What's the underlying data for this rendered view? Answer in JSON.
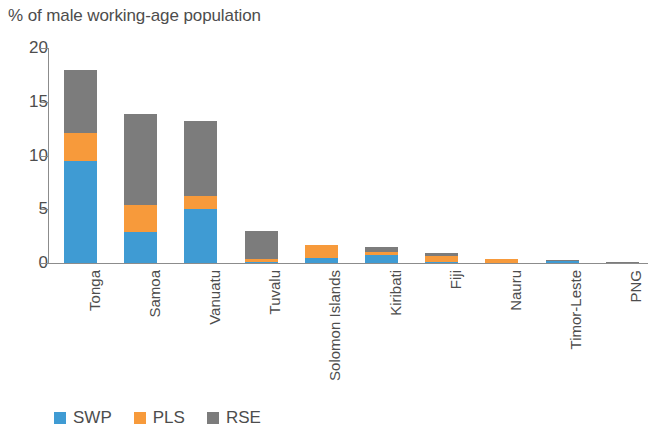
{
  "chart_data": {
    "type": "bar",
    "subtype": "stacked-vertical",
    "title": "% of male working-age population",
    "xlabel": "",
    "ylabel": "",
    "ylim": [
      0,
      20
    ],
    "yticks": [
      0,
      5,
      10,
      15,
      20
    ],
    "ytick_labels": [
      "0",
      "5",
      "10",
      "15",
      "20"
    ],
    "grid": false,
    "legend_position": "bottom-left",
    "categories": [
      "Tonga",
      "Samoa",
      "Vanuatu",
      "Tuvalu",
      "Solomon Islands",
      "Kiribati",
      "Fiji",
      "Nauru",
      "Timor-Leste",
      "PNG"
    ],
    "series": [
      {
        "name": "SWP",
        "color": "#3f9bd3",
        "values": [
          9.5,
          2.9,
          5.0,
          0.1,
          0.45,
          0.75,
          0.1,
          0.0,
          0.15,
          0.0
        ]
      },
      {
        "name": "PLS",
        "color": "#f79a3b",
        "values": [
          2.6,
          2.5,
          1.2,
          0.3,
          1.25,
          0.3,
          0.6,
          0.35,
          0.0,
          0.0
        ]
      },
      {
        "name": "RSE",
        "color": "#7c7c7c",
        "values": [
          5.9,
          8.5,
          7.0,
          2.6,
          0.0,
          0.45,
          0.2,
          0.0,
          0.1,
          0.05
        ]
      }
    ],
    "totals": [
      18.0,
      13.9,
      13.2,
      3.0,
      1.7,
      1.5,
      0.9,
      0.35,
      0.25,
      0.05
    ]
  },
  "legend": {
    "items": [
      {
        "label": "SWP",
        "color": "#3f9bd3"
      },
      {
        "label": "PLS",
        "color": "#f79a3b"
      },
      {
        "label": "RSE",
        "color": "#7c7c7c"
      }
    ]
  },
  "axis": {
    "line_color": "#8c8c8c"
  }
}
